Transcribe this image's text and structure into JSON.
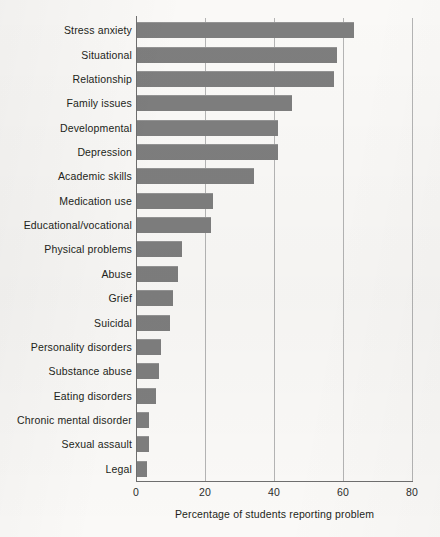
{
  "chart_data": {
    "type": "bar",
    "orientation": "horizontal",
    "title": "",
    "xlabel": "Percentage of students reporting problem",
    "ylabel": "",
    "xlim": [
      0,
      80
    ],
    "xticks": [
      0,
      20,
      40,
      60,
      80
    ],
    "xtick_labels": [
      "0",
      "20",
      "40",
      "60",
      "80"
    ],
    "grid": "vertical",
    "legend": "none",
    "bar_color": "#7e7e7e",
    "background_color": "#faf9f7",
    "axis_color": "#6f6f6f",
    "categories": [
      "Stress anxiety",
      "Situational",
      "Relationship",
      "Family issues",
      "Developmental",
      "Depression",
      "Academic skills",
      "Medication use",
      "Educational/vocational",
      "Physical problems",
      "Abuse",
      "Grief",
      "Suicidal",
      "Personality disorders",
      "Substance abuse",
      "Eating disorders",
      "Chronic mental disorder",
      "Sexual assault",
      "Legal"
    ],
    "values": [
      63,
      58,
      57,
      45,
      41,
      41,
      34,
      22,
      21.5,
      13,
      12,
      10.5,
      9.5,
      7,
      6.5,
      5.5,
      3.5,
      3.5,
      3
    ]
  },
  "axis": {
    "x_title": "Percentage of students reporting problem"
  }
}
